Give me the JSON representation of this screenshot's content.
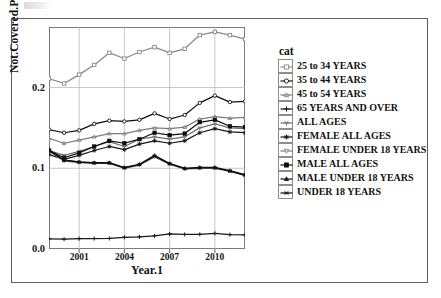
{
  "chart_data": {
    "type": "line",
    "title": "",
    "xlabel": "Year.1",
    "ylabel": "Not.Covered.Pct",
    "legend_title": "cat",
    "legend_position": "right",
    "grid": true,
    "xlim": [
      1999,
      2012
    ],
    "ylim": [
      0.0,
      0.275
    ],
    "xticks": [
      2001,
      2004,
      2007,
      2010
    ],
    "xticklabels": [
      "2001",
      "2004",
      "2007",
      "2010"
    ],
    "yticks": [
      0.0,
      0.1,
      0.2
    ],
    "yticklabels": [
      "0.0",
      "0.1",
      "0.2"
    ],
    "x": [
      1999,
      2000,
      2001,
      2002,
      2003,
      2004,
      2005,
      2006,
      2007,
      2008,
      2009,
      2010,
      2011,
      2012
    ],
    "series": [
      {
        "name": "25 to 34 YEARS",
        "marker": "square-open",
        "color": "#8a8a8a",
        "values": [
          0.211,
          0.205,
          0.216,
          0.228,
          0.243,
          0.236,
          0.244,
          0.25,
          0.243,
          0.248,
          0.265,
          0.269,
          0.265,
          0.26
        ]
      },
      {
        "name": "35 to 44 YEARS",
        "marker": "circle-open",
        "color": "#111111",
        "values": [
          0.148,
          0.144,
          0.147,
          0.155,
          0.159,
          0.158,
          0.16,
          0.168,
          0.161,
          0.166,
          0.181,
          0.19,
          0.182,
          0.183
        ]
      },
      {
        "name": "45 to 54 YEARS",
        "marker": "triangle-open",
        "color": "#7d7d7d",
        "values": [
          0.137,
          0.131,
          0.135,
          0.139,
          0.143,
          0.143,
          0.147,
          0.15,
          0.149,
          0.151,
          0.161,
          0.164,
          0.162,
          0.163
        ]
      },
      {
        "name": "65 YEARS AND OVER",
        "marker": "plus",
        "color": "#1a1a1a",
        "values": [
          0.0125,
          0.0122,
          0.0128,
          0.013,
          0.0131,
          0.0145,
          0.015,
          0.0163,
          0.0186,
          0.018,
          0.0182,
          0.0193,
          0.0178,
          0.0175
        ]
      },
      {
        "name": "ALL AGES",
        "marker": "y-down",
        "color": "#6f6f6f",
        "values": [
          0.122,
          0.116,
          0.121,
          0.127,
          0.133,
          0.127,
          0.136,
          0.139,
          0.136,
          0.139,
          0.15,
          0.155,
          0.15,
          0.149
        ]
      },
      {
        "name": "FEMALE ALL AGES",
        "marker": "star",
        "color": "#181818",
        "values": [
          0.117,
          0.111,
          0.116,
          0.122,
          0.127,
          0.123,
          0.13,
          0.134,
          0.131,
          0.134,
          0.144,
          0.149,
          0.145,
          0.144
        ]
      },
      {
        "name": "FEMALE UNDER 18 YEARS",
        "marker": "tri-down-open",
        "color": "#7a7a7a",
        "values": [
          0.121,
          0.109,
          0.107,
          0.106,
          0.106,
          0.1,
          0.104,
          0.114,
          0.105,
          0.099,
          0.1,
          0.1,
          0.096,
          0.091
        ]
      },
      {
        "name": "MALE ALL AGES",
        "marker": "square-filled",
        "color": "#0d0d0d",
        "values": [
          0.122,
          0.113,
          0.119,
          0.127,
          0.134,
          0.131,
          0.136,
          0.144,
          0.141,
          0.143,
          0.157,
          0.16,
          0.152,
          0.151
        ]
      },
      {
        "name": "MALE UNDER 18 YEARS",
        "marker": "tri-up-filled",
        "color": "#141414",
        "values": [
          0.123,
          0.11,
          0.108,
          0.107,
          0.107,
          0.101,
          0.105,
          0.116,
          0.106,
          0.1,
          0.101,
          0.101,
          0.097,
          0.092
        ]
      },
      {
        "name": "UNDER 18 YEARS",
        "marker": "asterisk",
        "color": "#101010",
        "values": [
          0.122,
          0.11,
          0.1075,
          0.1065,
          0.1065,
          0.1005,
          0.1045,
          0.115,
          0.1055,
          0.0995,
          0.1005,
          0.1005,
          0.0965,
          0.0915
        ]
      }
    ]
  }
}
